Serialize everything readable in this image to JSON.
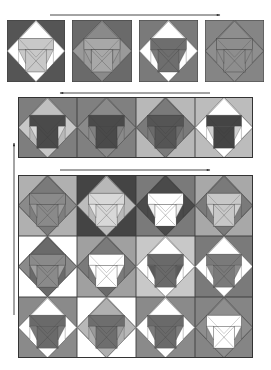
{
  "figure": {
    "arrows": [
      {
        "id": "arrow-row1",
        "direction": "right",
        "x1": 50,
        "y1": 15,
        "x2": 220,
        "y2": 15
      },
      {
        "id": "arrow-row2",
        "direction": "left",
        "x1": 210,
        "y1": 93,
        "x2": 60,
        "y2": 93
      },
      {
        "id": "arrow-row3",
        "direction": "right",
        "x1": 60,
        "y1": 170,
        "x2": 210,
        "y2": 170
      },
      {
        "id": "arrow-vertical",
        "direction": "up",
        "x1": 14,
        "y1": 315,
        "x2": 14,
        "y2": 143
      }
    ],
    "colors": {
      "white": "#ffffff",
      "light": "#d0d0d0",
      "lightmid": "#b4b4b4",
      "mid": "#8e8e8e",
      "midDark": "#767676",
      "dark": "#5a5a5a",
      "darker": "#444444",
      "line": "#3a3a3a"
    },
    "row1": [
      {
        "x": 7,
        "y": 20,
        "w": 58,
        "h": 62,
        "bg": "#555555",
        "diamond": "#ffffff",
        "hat": "#ffffff",
        "shoulders": "#c8c8c8",
        "body": "#c8c8c8",
        "wings": "#ffffff",
        "inner": "#c8c8c8",
        "bottom": "#ffffff"
      },
      {
        "x": 72,
        "y": 20,
        "w": 60,
        "h": 62,
        "bg": "#6a6a6a",
        "diamond": "#9a9a9a",
        "hat": "#8a8a8a",
        "shoulders": "#a8a8a8",
        "body": "#a8a8a8",
        "wings": "#9a9a9a",
        "inner": "#a0a0a0",
        "bottom": "#8a8a8a"
      },
      {
        "x": 139,
        "y": 20,
        "w": 59,
        "h": 62,
        "bg": "#7a7a7a",
        "diamond": "#ffffff",
        "hat": "#ffffff",
        "shoulders": "#6e6e6e",
        "body": "#6e6e6e",
        "wings": "#ffffff",
        "inner": "#7a7a7a",
        "bottom": "#ffffff"
      },
      {
        "x": 205,
        "y": 20,
        "w": 59,
        "h": 62,
        "bg": "#858585",
        "diamond": "#8e8e8e",
        "hat": "#8e8e8e",
        "shoulders": "#8e8e8e",
        "body": "#8e8e8e",
        "wings": "#8e8e8e",
        "inner": "#8e8e8e",
        "bottom": "#8e8e8e"
      }
    ],
    "row2": [
      {
        "x": 18,
        "y": 97,
        "w": 59,
        "h": 61,
        "bg": "#7e7e7e",
        "diamond": "#b8b8b8",
        "hat": "#c0c0c0",
        "shoulders": "#4a4a4a",
        "body": "#4a4a4a",
        "wings": "#c8c8c8",
        "inner": "#d8d8d8",
        "bottom": "#c8c8c8"
      },
      {
        "x": 77,
        "y": 97,
        "w": 59,
        "h": 61,
        "bg": "#808080",
        "diamond": "#8a8a8a",
        "hat": "#8a8a8a",
        "shoulders": "#4a4a4a",
        "body": "#4a4a4a",
        "wings": "#8a8a8a",
        "inner": "#808080",
        "bottom": "#8a8a8a"
      },
      {
        "x": 136,
        "y": 97,
        "w": 59,
        "h": 61,
        "bg": "#b8b8b8",
        "diamond": "#7a7a7a",
        "hat": "#7a7a7a",
        "shoulders": "#555555",
        "body": "#555555",
        "wings": "#7a7a7a",
        "inner": "#6a6a6a",
        "bottom": "#7a7a7a"
      },
      {
        "x": 195,
        "y": 97,
        "w": 58,
        "h": 61,
        "bg": "#bcbcbc",
        "diamond": "#ffffff",
        "hat": "#ffffff",
        "shoulders": "#444444",
        "body": "#444444",
        "wings": "#ffffff",
        "inner": "#d0d0d0",
        "bottom": "#ffffff"
      }
    ],
    "grid": [
      {
        "x": 18,
        "y": 175,
        "w": 59,
        "h": 61,
        "bg": "#b0b0b0",
        "diamond": "#7e7e7e",
        "hat": "#7a7a7a",
        "shoulders": "#8a8a8a",
        "body": "#8a8a8a",
        "wings": "#8a8a8a",
        "inner": "#9a9a9a",
        "bottom": "#7a7a7a"
      },
      {
        "x": 77,
        "y": 175,
        "w": 59,
        "h": 61,
        "bg": "#444444",
        "diamond": "#b8b8b8",
        "hat": "#b8b8b8",
        "shoulders": "#d8d8d8",
        "body": "#d8d8d8",
        "wings": "#bcbcbc",
        "inner": "#e4e4e4",
        "bottom": "#bcbcbc"
      },
      {
        "x": 136,
        "y": 175,
        "w": 59,
        "h": 61,
        "bg": "#7a7a7a",
        "diamond": "#4a4a4a",
        "hat": "#4a4a4a",
        "shoulders": "#ffffff",
        "body": "#ffffff",
        "wings": "#4a4a4a",
        "inner": "#f0f0f0",
        "bottom": "#4a4a4a"
      },
      {
        "x": 195,
        "y": 175,
        "w": 58,
        "h": 61,
        "bg": "#a8a8a8",
        "diamond": "#7e7e7e",
        "hat": "#7a7a7a",
        "shoulders": "#c8c8c8",
        "body": "#c8c8c8",
        "wings": "#7a7a7a",
        "inner": "#d0d0d0",
        "bottom": "#7a7a7a"
      },
      {
        "x": 18,
        "y": 236,
        "w": 59,
        "h": 61,
        "bg": "#ffffff",
        "diamond": "#6a6a6a",
        "hat": "#6a6a6a",
        "shoulders": "#8a8a8a",
        "body": "#8a8a8a",
        "wings": "#8a8a8a",
        "inner": "#a0a0a0",
        "bottom": "#6a6a6a"
      },
      {
        "x": 77,
        "y": 236,
        "w": 59,
        "h": 61,
        "bg": "#a0a0a0",
        "diamond": "#7a7a7a",
        "hat": "#7a7a7a",
        "shoulders": "#ffffff",
        "body": "#ffffff",
        "wings": "#7a7a7a",
        "inner": "#ffffff",
        "bottom": "#6a6a6a"
      },
      {
        "x": 136,
        "y": 236,
        "w": 59,
        "h": 61,
        "bg": "#c8c8c8",
        "diamond": "#ffffff",
        "hat": "#ffffff",
        "shoulders": "#6a6a6a",
        "body": "#6a6a6a",
        "wings": "#ffffff",
        "inner": "#5a5a5a",
        "bottom": "#ffffff"
      },
      {
        "x": 195,
        "y": 236,
        "w": 58,
        "h": 61,
        "bg": "#7a7a7a",
        "diamond": "#ffffff",
        "hat": "#ffffff",
        "shoulders": "#7a7a7a",
        "body": "#7a7a7a",
        "wings": "#ffffff",
        "inner": "#8a8a8a",
        "bottom": "#ffffff"
      },
      {
        "x": 18,
        "y": 297,
        "w": 59,
        "h": 61,
        "bg": "#8a8a8a",
        "diamond": "#ffffff",
        "hat": "#ffffff",
        "shoulders": "#6a6a6a",
        "body": "#6a6a6a",
        "wings": "#ffffff",
        "inner": "#7a7a7a",
        "bottom": "#ffffff"
      },
      {
        "x": 77,
        "y": 297,
        "w": 59,
        "h": 61,
        "bg": "#ffffff",
        "diamond": "#b0b0b0",
        "hat": "#b0b0b0",
        "shoulders": "#6e6e6e",
        "body": "#6e6e6e",
        "wings": "#b8b8b8",
        "inner": "#9a9a9a",
        "bottom": "#b0b0b0"
      },
      {
        "x": 136,
        "y": 297,
        "w": 59,
        "h": 61,
        "bg": "#8a8a8a",
        "diamond": "#ffffff",
        "hat": "#ffffff",
        "shoulders": "#6a6a6a",
        "body": "#6a6a6a",
        "wings": "#ffffff",
        "inner": "#7a7a7a",
        "bottom": "#ffffff"
      },
      {
        "x": 195,
        "y": 297,
        "w": 58,
        "h": 61,
        "bg": "#858585",
        "diamond": "#8e8e8e",
        "hat": "#8e8e8e",
        "shoulders": "#ffffff",
        "body": "#ffffff",
        "wings": "#8e8e8e",
        "inner": "#ffffff",
        "bottom": "#8e8e8e"
      }
    ]
  }
}
